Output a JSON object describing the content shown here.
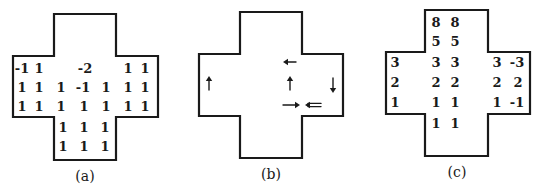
{
  "figure": {
    "panels": [
      {
        "id": "a",
        "caption": "(a)",
        "caption_pos": [
          85,
          176
        ],
        "outline": [
          [
            54,
            14
          ],
          [
            116,
            14
          ],
          [
            116,
            56
          ],
          [
            158,
            56
          ],
          [
            158,
            117
          ],
          [
            116,
            117
          ],
          [
            116,
            160
          ],
          [
            54,
            160
          ],
          [
            54,
            117
          ],
          [
            13,
            117
          ],
          [
            13,
            56
          ],
          [
            54,
            56
          ]
        ],
        "cells": [
          {
            "x": 22,
            "y": 68,
            "t": "-1"
          },
          {
            "x": 39,
            "y": 68,
            "t": "1"
          },
          {
            "x": 85,
            "y": 68,
            "t": "-2"
          },
          {
            "x": 128,
            "y": 68,
            "t": "1"
          },
          {
            "x": 145,
            "y": 68,
            "t": "1"
          },
          {
            "x": 22,
            "y": 87,
            "t": "1"
          },
          {
            "x": 39,
            "y": 87,
            "t": "1"
          },
          {
            "x": 61,
            "y": 87,
            "t": "1"
          },
          {
            "x": 83,
            "y": 87,
            "t": "-1"
          },
          {
            "x": 106,
            "y": 87,
            "t": "1"
          },
          {
            "x": 128,
            "y": 87,
            "t": "1"
          },
          {
            "x": 145,
            "y": 87,
            "t": "1"
          },
          {
            "x": 22,
            "y": 106,
            "t": "1"
          },
          {
            "x": 39,
            "y": 106,
            "t": "1"
          },
          {
            "x": 61,
            "y": 106,
            "t": "1"
          },
          {
            "x": 84,
            "y": 106,
            "t": "1"
          },
          {
            "x": 106,
            "y": 106,
            "t": "1"
          },
          {
            "x": 128,
            "y": 106,
            "t": "1"
          },
          {
            "x": 145,
            "y": 106,
            "t": "1"
          },
          {
            "x": 63,
            "y": 127,
            "t": "1"
          },
          {
            "x": 84,
            "y": 127,
            "t": "1"
          },
          {
            "x": 105,
            "y": 127,
            "t": "1"
          },
          {
            "x": 63,
            "y": 146,
            "t": "1"
          },
          {
            "x": 84,
            "y": 146,
            "t": "1"
          },
          {
            "x": 105,
            "y": 146,
            "t": "1"
          }
        ]
      },
      {
        "id": "b",
        "caption": "(b)",
        "caption_pos": [
          271,
          174
        ],
        "outline": [
          [
            240,
            12
          ],
          [
            302,
            12
          ],
          [
            302,
            54
          ],
          [
            343,
            54
          ],
          [
            343,
            116
          ],
          [
            302,
            116
          ],
          [
            302,
            158
          ],
          [
            240,
            158
          ],
          [
            240,
            116
          ],
          [
            199,
            116
          ],
          [
            199,
            54
          ],
          [
            240,
            54
          ]
        ],
        "arrows": [
          {
            "name": "arrow-left-top",
            "x1": 296,
            "y1": 62,
            "x2": 283,
            "y2": 62,
            "double": false
          },
          {
            "name": "arrow-up-center",
            "x1": 290,
            "y1": 90,
            "x2": 290,
            "y2": 76,
            "double": false
          },
          {
            "name": "arrow-up-left-arm",
            "x1": 209,
            "y1": 90,
            "x2": 209,
            "y2": 76,
            "double": false
          },
          {
            "name": "arrow-down-right-arm",
            "x1": 333,
            "y1": 78,
            "x2": 333,
            "y2": 93,
            "double": false
          },
          {
            "name": "arrow-right-bottom",
            "x1": 283,
            "y1": 105,
            "x2": 300,
            "y2": 105,
            "double": false
          },
          {
            "name": "double-arrow-left-bottom",
            "x1": 321,
            "y1": 105,
            "x2": 305,
            "y2": 105,
            "double": true
          }
        ]
      },
      {
        "id": "c",
        "caption": "(c)",
        "caption_pos": [
          457,
          172
        ],
        "outline": [
          [
            425,
            10
          ],
          [
            488,
            10
          ],
          [
            488,
            52
          ],
          [
            530,
            52
          ],
          [
            530,
            114
          ],
          [
            488,
            114
          ],
          [
            488,
            156
          ],
          [
            425,
            156
          ],
          [
            425,
            114
          ],
          [
            386,
            114
          ],
          [
            386,
            52
          ],
          [
            425,
            52
          ]
        ],
        "cells": [
          {
            "x": 436,
            "y": 22,
            "t": "8"
          },
          {
            "x": 455,
            "y": 22,
            "t": "8"
          },
          {
            "x": 436,
            "y": 41,
            "t": "5"
          },
          {
            "x": 455,
            "y": 41,
            "t": "5"
          },
          {
            "x": 395,
            "y": 62,
            "t": "3"
          },
          {
            "x": 436,
            "y": 62,
            "t": "3"
          },
          {
            "x": 455,
            "y": 62,
            "t": "3"
          },
          {
            "x": 497,
            "y": 62,
            "t": "3"
          },
          {
            "x": 517,
            "y": 62,
            "t": "-3"
          },
          {
            "x": 395,
            "y": 82,
            "t": "2"
          },
          {
            "x": 436,
            "y": 82,
            "t": "2"
          },
          {
            "x": 455,
            "y": 82,
            "t": "2"
          },
          {
            "x": 497,
            "y": 82,
            "t": "2"
          },
          {
            "x": 518,
            "y": 82,
            "t": "2"
          },
          {
            "x": 395,
            "y": 102,
            "t": "1"
          },
          {
            "x": 436,
            "y": 102,
            "t": "1"
          },
          {
            "x": 455,
            "y": 102,
            "t": "1"
          },
          {
            "x": 497,
            "y": 102,
            "t": "1"
          },
          {
            "x": 517,
            "y": 102,
            "t": "-1"
          },
          {
            "x": 436,
            "y": 123,
            "t": "1"
          },
          {
            "x": 455,
            "y": 123,
            "t": "1"
          }
        ]
      }
    ],
    "colors": {
      "ink": "#1a1a1a",
      "background": "#ffffff"
    }
  }
}
